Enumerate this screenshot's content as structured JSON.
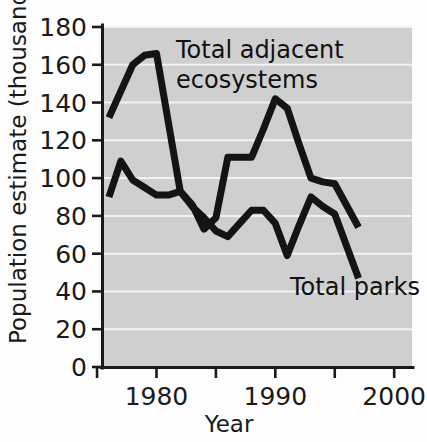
{
  "chart_data": {
    "type": "line",
    "title": "",
    "xlabel": "Year",
    "ylabel": "Population estimate (thousands)",
    "xlim": [
      1975.5,
      2001.5
    ],
    "ylim": [
      0,
      180
    ],
    "xticks": [
      1980,
      1985,
      1990,
      1995,
      2000
    ],
    "xtick_labels": [
      "1980",
      "",
      "1990",
      "",
      "2000"
    ],
    "yticks": [
      0,
      20,
      40,
      60,
      80,
      100,
      120,
      140,
      160,
      180
    ],
    "ytick_labels": [
      "0",
      "20",
      "40",
      "60",
      "80",
      "100",
      "120",
      "140",
      "160",
      "180"
    ],
    "grid": "horizontal",
    "legend_position": "inline-annotation",
    "plot_background_color": "#cfcfcf",
    "gridline_color": "#f2f2f2",
    "line_color": "#141414",
    "series": [
      {
        "name": "Total adjacent ecosystems",
        "label_text": "Total adjacent ecosystems",
        "label_line_1": "Total adjacent",
        "label_line_2": "ecosystems",
        "x": [
          1976,
          1978,
          1979,
          1980,
          1982,
          1983,
          1984,
          1985,
          1986,
          1987,
          1988,
          1989,
          1990,
          1991,
          1992,
          1993,
          1994,
          1995,
          1997
        ],
        "values": [
          132,
          160,
          165,
          166,
          93,
          86,
          73,
          79,
          111,
          111,
          111,
          126,
          142,
          137,
          118,
          100,
          98,
          97,
          74
        ]
      },
      {
        "name": "Total parks",
        "label_text": "Total parks",
        "x": [
          1976,
          1977,
          1978,
          1979,
          1980,
          1981,
          1982,
          1983,
          1984,
          1985,
          1986,
          1987,
          1988,
          1989,
          1990,
          1991,
          1992,
          1993,
          1994,
          1995,
          1997
        ],
        "values": [
          90,
          109,
          99,
          95,
          91,
          91,
          93,
          85,
          79,
          72,
          69,
          76,
          83,
          83,
          76,
          59,
          75,
          90,
          85,
          81,
          47
        ]
      }
    ]
  },
  "axes": {
    "y_title": "Population estimate (thousands)",
    "x_title": "Year"
  }
}
